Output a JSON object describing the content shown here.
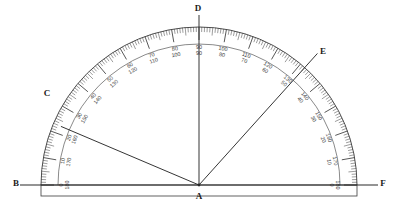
{
  "diagram": {
    "type": "protractor",
    "stroke_color": "#3a3a3a",
    "label_color": "#1a1a1a",
    "background": "#ffffff"
  },
  "geometry": {
    "center": {
      "x": 199,
      "y": 185
    },
    "radius_outer": 158,
    "radius_inner": 141,
    "baseline": {
      "x1": 20,
      "y1": 185,
      "x2": 378,
      "y2": 185
    },
    "base_rect": {
      "x": 41,
      "y": 185,
      "width": 316,
      "height": 11
    }
  },
  "points": [
    {
      "name": "B",
      "label": "B",
      "x": 16,
      "y": 186,
      "anchor": "middle"
    },
    {
      "name": "A",
      "label": "A",
      "x": 199,
      "y": 199,
      "anchor": "middle"
    },
    {
      "name": "F",
      "label": "F",
      "x": 383,
      "y": 186,
      "anchor": "middle"
    },
    {
      "name": "C",
      "label": "C",
      "x": 47,
      "y": 96,
      "anchor": "middle"
    },
    {
      "name": "D",
      "label": "D",
      "x": 198,
      "y": 11,
      "anchor": "middle"
    },
    {
      "name": "E",
      "label": "E",
      "x": 323,
      "y": 54,
      "anchor": "middle"
    }
  ],
  "rays": [
    {
      "name": "ray-AC",
      "from": "A",
      "to": "C",
      "angle_deg": 157,
      "length": 150
    },
    {
      "name": "ray-AD",
      "from": "A",
      "to": "D",
      "angle_deg": 90,
      "length": 170
    },
    {
      "name": "ray-AE",
      "from": "A",
      "to": "E",
      "angle_deg": 48,
      "length": 177
    }
  ],
  "scale": {
    "outer_values": [
      0,
      10,
      20,
      30,
      40,
      50,
      60,
      70,
      80,
      90,
      100,
      110,
      120,
      130,
      140,
      150,
      160,
      170,
      180
    ],
    "inner_values": [
      180,
      170,
      160,
      150,
      140,
      130,
      120,
      110,
      100,
      90,
      80,
      70,
      60,
      50,
      40,
      30,
      20,
      10,
      0
    ],
    "tick_step_deg": 1,
    "major_tick_step_deg": 10,
    "label_pairs": [
      {
        "angle": 180,
        "outer": "0",
        "inner": "180"
      },
      {
        "angle": 170,
        "outer": "10",
        "inner": "170"
      },
      {
        "angle": 160,
        "outer": "20",
        "inner": "160"
      },
      {
        "angle": 150,
        "outer": "30",
        "inner": "150"
      },
      {
        "angle": 140,
        "outer": "40",
        "inner": "140"
      },
      {
        "angle": 130,
        "outer": "50",
        "inner": "130"
      },
      {
        "angle": 120,
        "outer": "60",
        "inner": "120"
      },
      {
        "angle": 110,
        "outer": "70",
        "inner": "110"
      },
      {
        "angle": 100,
        "outer": "80",
        "inner": "100"
      },
      {
        "angle": 90,
        "outer": "90",
        "inner": "90"
      },
      {
        "angle": 80,
        "outer": "100",
        "inner": "80"
      },
      {
        "angle": 70,
        "outer": "110",
        "inner": "70"
      },
      {
        "angle": 60,
        "outer": "120",
        "inner": "60"
      },
      {
        "angle": 50,
        "outer": "130",
        "inner": "50"
      },
      {
        "angle": 40,
        "outer": "140",
        "inner": "40"
      },
      {
        "angle": 30,
        "outer": "150",
        "inner": "30"
      },
      {
        "angle": 20,
        "outer": "160",
        "inner": "20"
      },
      {
        "angle": 10,
        "outer": "170",
        "inner": "10"
      },
      {
        "angle": 0,
        "outer": "180",
        "inner": "0"
      }
    ]
  }
}
